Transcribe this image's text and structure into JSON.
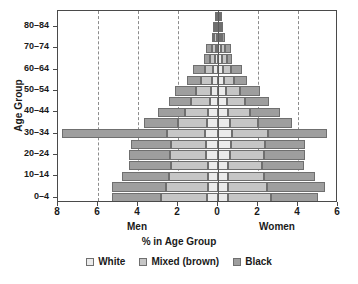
{
  "chart_data": {
    "type": "bar",
    "subtype": "population-pyramid",
    "title": "",
    "xlabel": "% in Age Group",
    "ylabel": "Age Group",
    "left_panel_label": "Men",
    "right_panel_label": "Women",
    "xlim": [
      -8,
      6
    ],
    "x_axis_unit": "percent",
    "x_tick_positions": [
      -8,
      -6,
      -4,
      -2,
      0,
      2,
      4,
      6
    ],
    "x_tick_labels": [
      "8",
      "6",
      "4",
      "2",
      "0",
      "2",
      "4",
      "6"
    ],
    "gridlines": {
      "vertical_dashed_at": [
        -6,
        -4,
        -2,
        2,
        4
      ],
      "horizontal": false
    },
    "legend": {
      "position": "bottom",
      "entries": [
        {
          "label": "White",
          "color": "#ebebeb"
        },
        {
          "label": "Mixed (brown)",
          "color": "#c6c6c6"
        },
        {
          "label": "Black",
          "color": "#9e9e9e"
        }
      ]
    },
    "categories": [
      "0-4",
      "5-9",
      "10-14",
      "15-19",
      "20-24",
      "25-29",
      "30-34",
      "35-39",
      "40-44",
      "45-49",
      "50-54",
      "55-59",
      "60-64",
      "65-69",
      "70-74",
      "75-79",
      "80-84",
      "85+"
    ],
    "y_tick_labels_shown": [
      "0-4",
      "10-14",
      "20-24",
      "30-34",
      "40-44",
      "50-54",
      "60-64",
      "70-74",
      "80-84"
    ],
    "series": [
      {
        "name": "Men White",
        "side": "left",
        "color": "#ebebeb",
        "values": [
          0.55,
          0.52,
          0.5,
          0.52,
          0.58,
          0.62,
          0.64,
          0.55,
          0.48,
          0.42,
          0.36,
          0.28,
          0.24,
          0.16,
          0.12,
          0.07,
          0.05,
          0.03
        ]
      },
      {
        "name": "Men Mixed (brown)",
        "side": "left",
        "color": "#c6c6c6",
        "values": [
          2.3,
          2.1,
          1.95,
          1.85,
          1.8,
          1.75,
          1.9,
          1.45,
          1.15,
          0.95,
          0.75,
          0.55,
          0.42,
          0.26,
          0.2,
          0.12,
          0.08,
          0.05
        ]
      },
      {
        "name": "Men Black",
        "side": "left",
        "color": "#9e9e9e",
        "values": [
          2.45,
          2.7,
          2.35,
          2.1,
          2.05,
          2.0,
          5.25,
          1.7,
          1.35,
          1.1,
          1.05,
          0.7,
          0.6,
          0.28,
          0.3,
          0.12,
          0.12,
          0.05
        ]
      },
      {
        "name": "Women White",
        "side": "right",
        "color": "#ebebeb",
        "values": [
          0.52,
          0.5,
          0.48,
          0.52,
          0.6,
          0.66,
          0.7,
          0.6,
          0.52,
          0.46,
          0.4,
          0.3,
          0.26,
          0.18,
          0.14,
          0.08,
          0.06,
          0.04
        ]
      },
      {
        "name": "Women Mixed (brown)",
        "side": "right",
        "color": "#c6c6c6",
        "values": [
          2.15,
          1.95,
          1.8,
          1.7,
          1.7,
          1.7,
          1.8,
          1.4,
          1.1,
          0.9,
          0.72,
          0.52,
          0.4,
          0.25,
          0.2,
          0.12,
          0.09,
          0.05
        ]
      },
      {
        "name": "Women Black",
        "side": "right",
        "color": "#9e9e9e",
        "values": [
          2.35,
          2.9,
          2.55,
          2.1,
          2.05,
          2.0,
          2.95,
          1.7,
          1.5,
          1.2,
          1.0,
          0.65,
          0.55,
          0.27,
          0.32,
          0.14,
          0.12,
          0.06
        ]
      }
    ]
  },
  "axes": {
    "ylabel": "Age Group",
    "xlabel": "% in Age Group",
    "men": "Men",
    "women": "Women"
  }
}
